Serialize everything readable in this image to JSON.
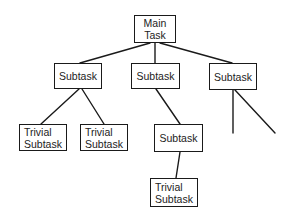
{
  "diagram": {
    "type": "tree",
    "line_color": "#1a1a1a",
    "nodes": {
      "main": {
        "label": "Main\nTask"
      },
      "sub_left": {
        "label": "Subtask"
      },
      "sub_mid": {
        "label": "Subtask"
      },
      "sub_right": {
        "label": "Subtask"
      },
      "trivial_left_1": {
        "label": "Trivial\nSubtask"
      },
      "trivial_left_2": {
        "label": "Trivial\nSubtask"
      },
      "sub_mid_child": {
        "label": "Subtask"
      },
      "trivial_mid": {
        "label": "Trivial\nSubtask"
      }
    },
    "edges": [
      [
        "main",
        "sub_left"
      ],
      [
        "main",
        "sub_mid"
      ],
      [
        "main",
        "sub_right"
      ],
      [
        "sub_left",
        "trivial_left_1"
      ],
      [
        "sub_left",
        "trivial_left_2"
      ],
      [
        "sub_mid",
        "sub_mid_child"
      ],
      [
        "sub_mid_child",
        "trivial_mid"
      ],
      [
        "sub_right",
        "(open branch)"
      ],
      [
        "sub_right",
        "(open branch)"
      ]
    ]
  }
}
